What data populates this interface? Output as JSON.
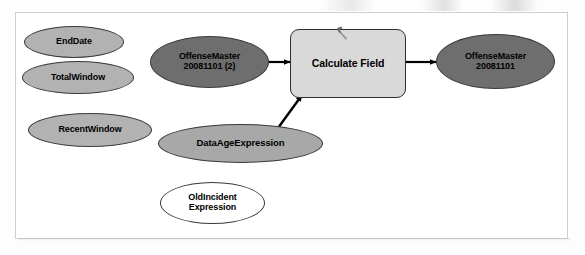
{
  "diagram": {
    "frame": {
      "border_color": "#cfcfcf",
      "background": "#ffffff"
    },
    "colors": {
      "variable_fill": "#b2b2b2",
      "data_fill": "#6e6e6e",
      "expression_fill": "#a8a8a8",
      "empty_fill": "#ffffff",
      "tool_fill": "#d9d9d9",
      "outline": "#2e2e2e",
      "connector": "#000000"
    },
    "nodes": [
      {
        "id": "end-date",
        "label": "EndDate",
        "shape": "ellipse",
        "kind": "variable",
        "fill": "#b2b2b2"
      },
      {
        "id": "total-window",
        "label": "TotalWindow",
        "shape": "ellipse",
        "kind": "variable",
        "fill": "#b2b2b2"
      },
      {
        "id": "recent-window",
        "label": "RecentWindow",
        "shape": "ellipse",
        "kind": "variable",
        "fill": "#b2b2b2"
      },
      {
        "id": "offense-master-input",
        "label": "OffenseMaster\n20081101 (2)",
        "shape": "ellipse",
        "kind": "data",
        "fill": "#6e6e6e"
      },
      {
        "id": "calculate-field",
        "label": "Calculate Field",
        "shape": "rounded-rect",
        "kind": "tool",
        "fill": "#d9d9d9",
        "icon": "hammer-icon"
      },
      {
        "id": "offense-master-output",
        "label": "OffenseMaster\n20081101",
        "shape": "ellipse",
        "kind": "data",
        "fill": "#6e6e6e"
      },
      {
        "id": "data-age-expression",
        "label": "DataAgeExpression",
        "shape": "ellipse",
        "kind": "variable",
        "fill": "#a8a8a8"
      },
      {
        "id": "old-incident-expression",
        "label": "OldIncident\nExpression",
        "shape": "ellipse",
        "kind": "variable",
        "fill": "#ffffff"
      }
    ],
    "connectors": [
      {
        "id": "input-to-tool",
        "from": "offense-master-input",
        "to": "calculate-field",
        "style": "arrow"
      },
      {
        "id": "expression-to-tool",
        "from": "data-age-expression",
        "to": "calculate-field",
        "style": "arrow"
      },
      {
        "id": "tool-to-output",
        "from": "calculate-field",
        "to": "offense-master-output",
        "style": "arrow"
      }
    ]
  }
}
